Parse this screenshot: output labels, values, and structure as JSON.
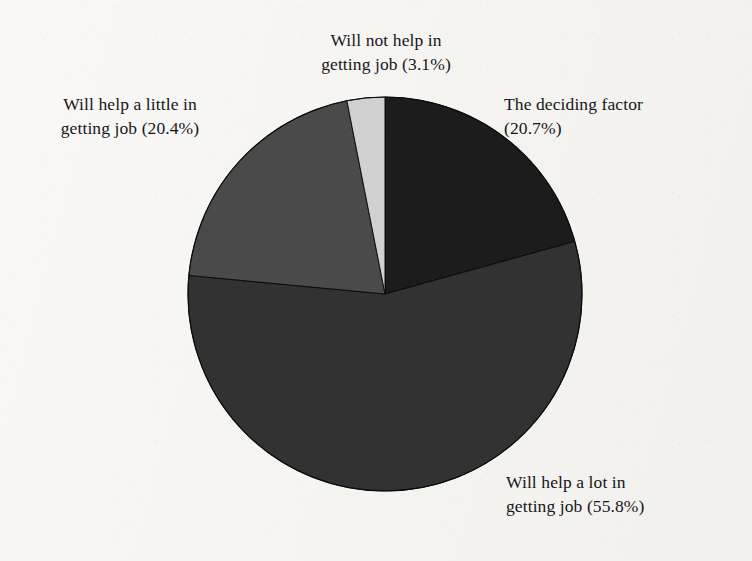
{
  "chart_data": {
    "type": "pie",
    "title": "Perceived usefulness of qualification in getting job",
    "xlabel": "",
    "ylabel": "",
    "legend_position": "none",
    "grid": false,
    "labels_show_percent": true,
    "categories": [
      "The deciding factor",
      "Will help a lot in getting job",
      "Will help a little in getting job",
      "Will not help in getting job"
    ],
    "values": [
      20.7,
      55.8,
      20.4,
      3.1
    ],
    "units": "%",
    "total": 100.0,
    "start_angle_deg": 0,
    "direction": "clockwise",
    "slices": [
      {
        "name": "deciding-factor",
        "label": "The deciding factor",
        "percent": 20.7,
        "percent_text": "(20.7%)",
        "color": "#1b1b1b",
        "start_deg": 0,
        "end_deg": 74.52,
        "label_position": "right-top"
      },
      {
        "name": "help-a-lot",
        "label": "Will help a lot in getting job",
        "percent": 55.8,
        "percent_text": "(55.8%)",
        "color": "#333333",
        "start_deg": 74.52,
        "end_deg": 275.4,
        "label_position": "right-bottom"
      },
      {
        "name": "help-a-little",
        "label": "Will help a little in getting job",
        "percent": 20.4,
        "percent_text": "(20.4%)",
        "color": "#4c4c4c",
        "start_deg": 275.4,
        "end_deg": 348.84,
        "label_position": "left-top"
      },
      {
        "name": "will-not-help",
        "label": "Will not help in getting job",
        "percent": 3.1,
        "percent_text": "(3.1%)",
        "color": "#d6d6d6",
        "start_deg": 348.84,
        "end_deg": 360,
        "label_position": "top-center"
      }
    ]
  },
  "labels": {
    "not_help": "Will not help in\ngetting job (3.1%)",
    "little": "Will help a little in\ngetting job (20.4%)",
    "deciding": "The deciding factor\n(20.7%)",
    "lot": "Will help a lot in\ngetting job (55.8%)"
  },
  "colors": {
    "background": "#f5f3ef",
    "text": "#16161a",
    "slice_deciding": "#1b1b1b",
    "slice_lot": "#333333",
    "slice_little": "#4c4c4c",
    "slice_not_help": "#d6d6d6",
    "outline": "#0d0d0d"
  },
  "geometry": {
    "center_x": 385,
    "center_y": 294,
    "radius": 197
  }
}
